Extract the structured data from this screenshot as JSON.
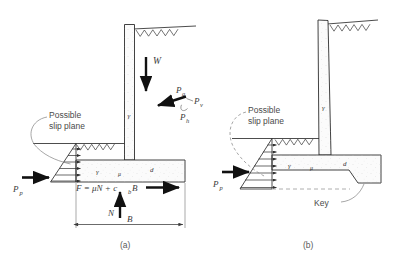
{
  "figure": {
    "colors": {
      "line": "#2d2d2d",
      "arrow": "#111111",
      "leader": "#8a8a8a",
      "dashed": "#9a9a9a",
      "concrete_fill": "#fbfbfb",
      "stipple": "#c9c9c9",
      "text": "#3a3a3a",
      "caption": "#5a5a5a"
    },
    "panels": [
      {
        "id": "a",
        "caption": "(a)",
        "description": "Retaining wall without key — resisting force from base friction and adhesion",
        "labels": {
          "slip_plane": "Possible\nslip plane",
          "slip_plane_line1": "Possible",
          "slip_plane_line2": "slip plane",
          "weight": "W",
          "active_thrust": "P",
          "active_thrust_sub": "a",
          "vertical_component": "P",
          "vertical_component_sub": "v",
          "horizontal_component": "P",
          "horizontal_component_sub": "h",
          "passive_pressure": "P",
          "passive_pressure_sub": "p",
          "normal_force": "N",
          "base_width": "B",
          "friction_equation": "F = μN + c",
          "friction_equation_sub": "b",
          "friction_equation_tail": "B"
        }
      },
      {
        "id": "b",
        "caption": "(b)",
        "description": "Retaining wall with key at base of footing — increased passive resistance",
        "labels": {
          "slip_plane_line1": "Possible",
          "slip_plane_line2": "slip plane",
          "passive_pressure": "P",
          "passive_pressure_sub": "p",
          "key": "Key"
        }
      }
    ]
  }
}
